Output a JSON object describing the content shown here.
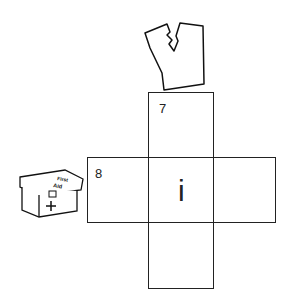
{
  "diagram": {
    "type": "cube-net",
    "faces": [
      {
        "id": "top",
        "label": "7"
      },
      {
        "id": "left",
        "label": "8"
      },
      {
        "id": "center",
        "label": "",
        "symbol": "i"
      },
      {
        "id": "right",
        "label": ""
      },
      {
        "id": "bottom",
        "label": ""
      }
    ],
    "images": [
      {
        "name": "torn-shirt-icon",
        "description": "Torn shirt/vest outline"
      },
      {
        "name": "first-aid-kit-icon",
        "description": "First Aid box",
        "text_line1": "First",
        "text_line2": "Aid"
      }
    ]
  }
}
